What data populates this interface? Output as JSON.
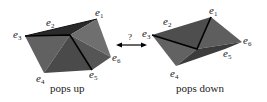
{
  "figure": {
    "left": {
      "caption": "pops up",
      "vertices": [
        "e1",
        "e2",
        "e3",
        "e4",
        "e5",
        "e6"
      ]
    },
    "right": {
      "caption": "pops down",
      "vertices": [
        "e1",
        "e2",
        "e3",
        "e4",
        "e5",
        "e6"
      ]
    },
    "arrow": {
      "label": "?",
      "type": "double-headed"
    },
    "colors": {
      "face_dark": "#3f3f3f",
      "face_mid": "#5a5a5a",
      "face_light": "#6e6e6e",
      "edge": "#000000"
    }
  },
  "labels": {
    "e": "e",
    "s1": "1",
    "s2": "2",
    "s3": "3",
    "s4": "4",
    "s5": "5",
    "s6": "6"
  }
}
